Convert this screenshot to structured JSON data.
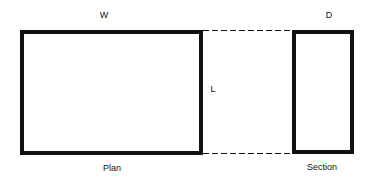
{
  "diagram": {
    "labels": {
      "width": "W",
      "depth": "D",
      "length": "L",
      "plan": "Plan",
      "section": "Section"
    },
    "shapes": {
      "plan_rect": {
        "x": 22,
        "y": 32,
        "w": 179,
        "h": 121
      },
      "section_rect": {
        "x": 294,
        "y": 32,
        "w": 58,
        "h": 120
      },
      "dashed_top": {
        "x1": 203,
        "y1": 30.5,
        "x2": 292,
        "y2": 30.5
      },
      "dashed_bottom": {
        "x1": 203,
        "y1": 153.5,
        "x2": 292,
        "y2": 153.5
      }
    },
    "colors": {
      "stroke": "#111111",
      "background": "#ffffff"
    }
  }
}
